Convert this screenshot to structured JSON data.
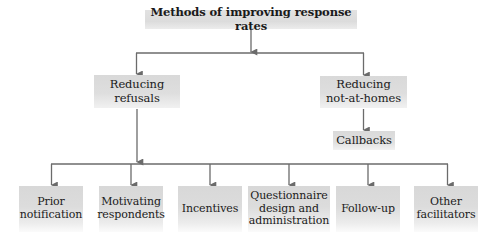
{
  "diagram": {
    "type": "hierarchy",
    "root": {
      "label": "Methods of improving response rates"
    },
    "branches": [
      {
        "label": "Reducing\nrefusals"
      },
      {
        "label": "Reducing\nnot-at-homes",
        "child": {
          "label": "Callbacks"
        }
      }
    ],
    "leaves": [
      {
        "label": "Prior\nnotification"
      },
      {
        "label": "Motivating\nrespondents"
      },
      {
        "label": "Incentives"
      },
      {
        "label": "Questionnaire\ndesign and\nadministration"
      },
      {
        "label": "Follow-up"
      },
      {
        "label": "Other\nfacilitators"
      }
    ],
    "leaves_parent": "Reducing refusals",
    "colors": {
      "box_fill": "#dadada",
      "box_fade": "#f5f5f5",
      "connector": "#6b6b6b",
      "text": "#1a1a1a",
      "background": "#ffffff"
    }
  }
}
